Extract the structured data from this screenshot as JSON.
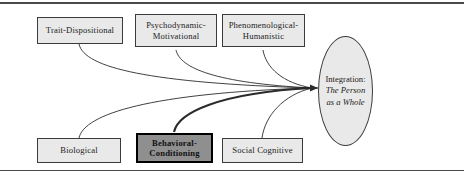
{
  "figure": {
    "top_rule": "horizontal-rule",
    "bottom_rule": "horizontal-rule"
  },
  "nodes": {
    "trait": {
      "label": "Trait-Dispositional"
    },
    "psychodynamic": {
      "label": "Psychodynamic-\nMotivational"
    },
    "phenomenological": {
      "label": "Phenomenological-\nHumanistic"
    },
    "biological": {
      "label": "Biological"
    },
    "behavioral": {
      "label": "Behavioral-\nConditioning"
    },
    "social_cognitive": {
      "label": "Social Cognitive"
    }
  },
  "target": {
    "line1": "Integration:",
    "line2": "The Person",
    "line3": "as a Whole"
  },
  "connectors": [
    {
      "from": "trait",
      "to": "target",
      "emphasis": "normal"
    },
    {
      "from": "psychodynamic",
      "to": "target",
      "emphasis": "normal"
    },
    {
      "from": "phenomenological",
      "to": "target",
      "emphasis": "normal"
    },
    {
      "from": "biological",
      "to": "target",
      "emphasis": "normal"
    },
    {
      "from": "behavioral",
      "to": "target",
      "emphasis": "bold"
    },
    {
      "from": "social_cognitive",
      "to": "target",
      "emphasis": "normal"
    }
  ],
  "colors": {
    "node_fill": "#e9e9e9",
    "node_border": "#3b3b3b",
    "highlight_fill": "#8f8f8f",
    "highlight_border": "#000000",
    "line": "#2b2b2b",
    "rule": "#4a4a4a",
    "background": "#ffffff"
  }
}
